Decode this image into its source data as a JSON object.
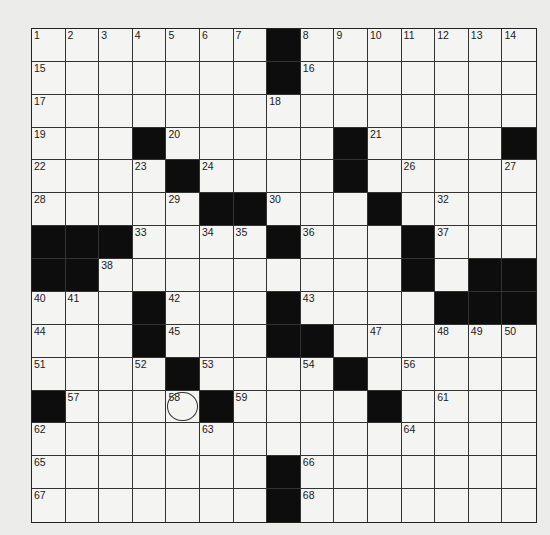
{
  "puzzle": {
    "size": 15,
    "rows": [
      "#######.#######",
      "#######.#######",
      "###############",
      "###.#####.####.",
      "####.####.#####",
      "#####..###.####",
      "...####.###.###",
      "..#########.#..",
      "###.###.####...",
      "###.###..######",
      "####.####.#####",
      ".####.####.####",
      "###############",
      "#######.#######",
      "#######.#######"
    ],
    "numbers": [
      {
        "r": 0,
        "c": 0,
        "n": "1"
      },
      {
        "r": 0,
        "c": 1,
        "n": "2"
      },
      {
        "r": 0,
        "c": 2,
        "n": "3"
      },
      {
        "r": 0,
        "c": 3,
        "n": "4"
      },
      {
        "r": 0,
        "c": 4,
        "n": "5"
      },
      {
        "r": 0,
        "c": 5,
        "n": "6"
      },
      {
        "r": 0,
        "c": 6,
        "n": "7"
      },
      {
        "r": 0,
        "c": 8,
        "n": "8"
      },
      {
        "r": 0,
        "c": 9,
        "n": "9"
      },
      {
        "r": 0,
        "c": 10,
        "n": "10"
      },
      {
        "r": 0,
        "c": 11,
        "n": "11"
      },
      {
        "r": 0,
        "c": 12,
        "n": "12"
      },
      {
        "r": 0,
        "c": 13,
        "n": "13"
      },
      {
        "r": 0,
        "c": 14,
        "n": "14"
      },
      {
        "r": 1,
        "c": 0,
        "n": "15"
      },
      {
        "r": 1,
        "c": 8,
        "n": "16"
      },
      {
        "r": 2,
        "c": 0,
        "n": "17"
      },
      {
        "r": 2,
        "c": 7,
        "n": "18"
      },
      {
        "r": 3,
        "c": 0,
        "n": "19"
      },
      {
        "r": 3,
        "c": 4,
        "n": "20"
      },
      {
        "r": 3,
        "c": 10,
        "n": "21"
      },
      {
        "r": 4,
        "c": 0,
        "n": "22"
      },
      {
        "r": 4,
        "c": 3,
        "n": "23"
      },
      {
        "r": 4,
        "c": 5,
        "n": "24"
      },
      {
        "r": 4,
        "c": 9,
        "n": "25"
      },
      {
        "r": 4,
        "c": 11,
        "n": "26"
      },
      {
        "r": 4,
        "c": 14,
        "n": "27"
      },
      {
        "r": 5,
        "c": 0,
        "n": "28"
      },
      {
        "r": 5,
        "c": 4,
        "n": "29"
      },
      {
        "r": 5,
        "c": 7,
        "n": "30"
      },
      {
        "r": 5,
        "c": 10,
        "n": "31"
      },
      {
        "r": 5,
        "c": 12,
        "n": "32"
      },
      {
        "r": 6,
        "c": 3,
        "n": "33"
      },
      {
        "r": 6,
        "c": 5,
        "n": "34"
      },
      {
        "r": 6,
        "c": 6,
        "n": "35"
      },
      {
        "r": 6,
        "c": 8,
        "n": "36"
      },
      {
        "r": 6,
        "c": 12,
        "n": "37"
      },
      {
        "r": 7,
        "c": 2,
        "n": "38"
      },
      {
        "r": 7,
        "c": 11,
        "n": "39"
      },
      {
        "r": 8,
        "c": 0,
        "n": "40"
      },
      {
        "r": 8,
        "c": 1,
        "n": "41"
      },
      {
        "r": 8,
        "c": 4,
        "n": "42"
      },
      {
        "r": 8,
        "c": 8,
        "n": "43"
      },
      {
        "r": 9,
        "c": 0,
        "n": "44"
      },
      {
        "r": 9,
        "c": 4,
        "n": "45"
      },
      {
        "r": 9,
        "c": 7,
        "n": "46"
      },
      {
        "r": 9,
        "c": 10,
        "n": "47"
      },
      {
        "r": 9,
        "c": 12,
        "n": "48"
      },
      {
        "r": 9,
        "c": 13,
        "n": "49"
      },
      {
        "r": 9,
        "c": 14,
        "n": "50"
      },
      {
        "r": 10,
        "c": 0,
        "n": "51"
      },
      {
        "r": 10,
        "c": 3,
        "n": "52"
      },
      {
        "r": 10,
        "c": 5,
        "n": "53"
      },
      {
        "r": 10,
        "c": 8,
        "n": "54"
      },
      {
        "r": 10,
        "c": 9,
        "n": "55"
      },
      {
        "r": 10,
        "c": 11,
        "n": "56"
      },
      {
        "r": 11,
        "c": 1,
        "n": "57"
      },
      {
        "r": 11,
        "c": 4,
        "n": "58"
      },
      {
        "r": 11,
        "c": 6,
        "n": "59"
      },
      {
        "r": 11,
        "c": 10,
        "n": "60"
      },
      {
        "r": 11,
        "c": 12,
        "n": "61"
      },
      {
        "r": 12,
        "c": 0,
        "n": "62"
      },
      {
        "r": 12,
        "c": 5,
        "n": "63"
      },
      {
        "r": 12,
        "c": 11,
        "n": "64"
      },
      {
        "r": 13,
        "c": 0,
        "n": "65"
      },
      {
        "r": 13,
        "c": 8,
        "n": "66"
      },
      {
        "r": 14,
        "c": 0,
        "n": "67"
      },
      {
        "r": 14,
        "c": 8,
        "n": "68"
      }
    ],
    "circled": [
      {
        "r": 11,
        "c": 4
      }
    ]
  }
}
